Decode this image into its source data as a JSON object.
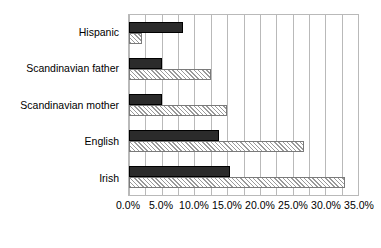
{
  "chart_data": {
    "type": "bar",
    "orientation": "horizontal",
    "title": "",
    "subtitle": "",
    "xlabel": "",
    "ylabel": "",
    "categories": [
      "Hispanic",
      "Scandinavian father",
      "Scandinavian mother",
      "English",
      "Irish"
    ],
    "series": [
      {
        "name": "series-1",
        "style": "solid-dark",
        "color": "#2b2b2b",
        "values": [
          8.3,
          5.0,
          5.0,
          13.8,
          15.5
        ]
      },
      {
        "name": "series-2",
        "style": "hatched-light",
        "color": "#f2f2f2",
        "values": [
          2.0,
          12.5,
          15.0,
          26.8,
          33.0
        ]
      }
    ],
    "xlim": [
      0,
      35
    ],
    "xtick_values": [
      0,
      5,
      10,
      15,
      20,
      25,
      30,
      35
    ],
    "xtick_labels": [
      "0.0%",
      "5.0%",
      "10.0%",
      "15.0%",
      "20.0%",
      "25.0%",
      "30.0%",
      "35.0%"
    ],
    "gridline_values": [
      0,
      2.5,
      5,
      7.5,
      10,
      12.5,
      15,
      17.5,
      20,
      22.5,
      25,
      27.5,
      30,
      32.5,
      35
    ],
    "grid": true,
    "grid_axis": "x",
    "legend": false,
    "legend_position": "none",
    "grid_color": "#b9b9b9",
    "axis_color": "#b9b9b9",
    "text_color": "#000000",
    "background": "#ffffff",
    "annotations": []
  }
}
